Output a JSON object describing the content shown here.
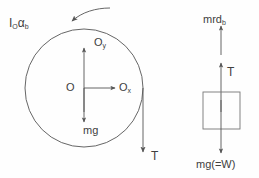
{
  "figure": {
    "background_color": "#fefefe",
    "stroke_color": "#555555",
    "text_color": "#404040"
  },
  "pulley": {
    "name": "pulley-circle",
    "center_x": 84,
    "center_y": 88,
    "radius": 59,
    "labels": {
      "inertia_torque": "I",
      "inertia_torque_sub": "O",
      "inertia_torque_alpha": "α",
      "inertia_torque_alpha_sub": "b",
      "center": "O",
      "reaction_x": "O",
      "reaction_x_sub": "x",
      "reaction_y": "O",
      "reaction_y_sub": "y",
      "weight": "mg",
      "tension": "T"
    }
  },
  "block": {
    "name": "hanging-block",
    "x": 203,
    "y": 92,
    "width": 37,
    "height": 37,
    "labels": {
      "inertia_force": "mrd",
      "inertia_force_sub": "b",
      "tension": "T",
      "weight": "mg(=W)"
    }
  },
  "arrows": {
    "angular_acceleration": "curved-ccw-arrow",
    "reaction_y": "up-arrow",
    "reaction_x": "right-arrow",
    "weight_pulley": "down-arrow",
    "tension_pulley": "down-arrow",
    "inertia_block": "up-arrow",
    "tension_block": "up-arrow",
    "weight_block": "down-arrow"
  }
}
